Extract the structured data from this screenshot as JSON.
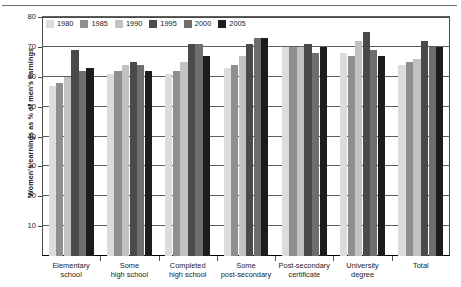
{
  "chart_data": {
    "type": "bar",
    "title": "",
    "xlabel": "",
    "ylabel": "Women's earnings as % of men's earnings",
    "ylim": [
      0,
      80
    ],
    "yticks": [
      10,
      20,
      30,
      40,
      50,
      60,
      70,
      80
    ],
    "grid": true,
    "legend_position": "top-left",
    "categories": [
      "Elementary school",
      "Some high school",
      "Completed high school",
      "Some post-secondary",
      "Post-secondary certificate",
      "University degree",
      "Total"
    ],
    "category_lines": [
      [
        "Elementary",
        "school"
      ],
      [
        "Some",
        "high school"
      ],
      [
        "Completed",
        "high school"
      ],
      [
        "Some",
        "post-secondary"
      ],
      [
        "Post-secondary",
        "certificate"
      ],
      [
        "University",
        "degree"
      ],
      [
        "Total",
        ""
      ]
    ],
    "series": [
      {
        "name": "1980",
        "color": "#dcdcdc",
        "values": [
          57,
          61,
          61,
          63,
          70,
          68,
          64
        ]
      },
      {
        "name": "1985",
        "color": "#8f8f8f",
        "values": [
          58,
          62,
          62,
          64,
          70,
          67,
          65
        ]
      },
      {
        "name": "1990",
        "color": "#c2c2c2",
        "values": [
          60,
          64,
          65,
          67,
          70,
          72,
          66
        ]
      },
      {
        "name": "1995",
        "color": "#4a4a4a",
        "values": [
          69,
          65,
          71,
          71,
          71,
          75,
          72
        ]
      },
      {
        "name": "2000",
        "color": "#6e6e6e",
        "values": [
          62,
          64,
          71,
          73,
          68,
          69,
          70
        ]
      },
      {
        "name": "2005",
        "color": "#1c1c1c",
        "values": [
          63,
          62,
          67,
          73,
          70,
          67,
          70
        ]
      }
    ]
  },
  "legend": {
    "items": [
      {
        "label": "1980"
      },
      {
        "label": "1985"
      },
      {
        "label": "1990"
      },
      {
        "label": "1995"
      },
      {
        "label": "2000"
      },
      {
        "label": "2005"
      }
    ]
  }
}
